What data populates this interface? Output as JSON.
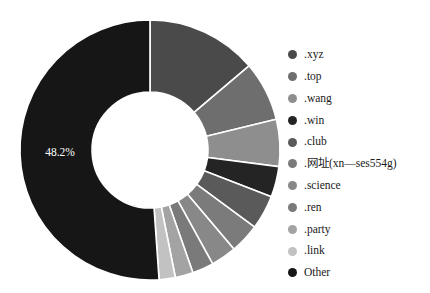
{
  "chart_data": {
    "type": "pie",
    "variant": "donut",
    "title": "",
    "subtitle": "",
    "xlabel": "",
    "ylabel": "",
    "legend_position": "right",
    "grid": false,
    "start_angle_deg": 0,
    "direction": "clockwise",
    "hole_ratio": 0.45,
    "labels_shown": [
      "48.2%"
    ],
    "categories": [
      ".xyz",
      ".top",
      ".wang",
      ".win",
      ".club",
      ".网址(xn—ses554g)",
      ".science",
      ".ren",
      ".party",
      ".link",
      "Other"
    ],
    "values": [
      13.0,
      7.0,
      5.5,
      3.6,
      4.0,
      3.5,
      3.0,
      2.5,
      2.1,
      1.9,
      48.2
    ],
    "unit": "%",
    "colors": [
      "#4a4a4a",
      "#6e6e6e",
      "#8e8e8e",
      "#242424",
      "#5a5a5a",
      "#7b7b7b",
      "#888888",
      "#7a7a7a",
      "#a3a3a3",
      "#c2c2c2",
      "#161616"
    ],
    "slices": [
      {
        "label": ".xyz",
        "value": 13.0,
        "color": "#4a4a4a"
      },
      {
        "label": ".top",
        "value": 7.0,
        "color": "#6e6e6e"
      },
      {
        "label": ".wang",
        "value": 5.5,
        "color": "#8e8e8e"
      },
      {
        "label": ".win",
        "value": 3.6,
        "color": "#242424"
      },
      {
        "label": ".club",
        "value": 4.0,
        "color": "#5a5a5a"
      },
      {
        "label": ".网址(xn—ses554g)",
        "value": 3.5,
        "color": "#7b7b7b"
      },
      {
        "label": ".science",
        "value": 3.0,
        "color": "#888888"
      },
      {
        "label": ".ren",
        "value": 2.5,
        "color": "#7a7a7a"
      },
      {
        "label": ".party",
        "value": 2.1,
        "color": "#a3a3a3"
      },
      {
        "label": ".link",
        "value": 1.9,
        "color": "#c2c2c2"
      },
      {
        "label": "Other",
        "value": 48.2,
        "color": "#161616"
      }
    ]
  },
  "annotations": {
    "other_percent_label": "48.2%"
  },
  "legend": {
    "items": [
      {
        "label": ".xyz",
        "color": "#4a4a4a"
      },
      {
        "label": ".top",
        "color": "#6e6e6e"
      },
      {
        "label": ".wang",
        "color": "#8e8e8e"
      },
      {
        "label": ".win",
        "color": "#242424"
      },
      {
        "label": ".club",
        "color": "#5a5a5a"
      },
      {
        "label": ".网址(xn—ses554g)",
        "color": "#7b7b7b"
      },
      {
        "label": ".science",
        "color": "#888888"
      },
      {
        "label": ".ren",
        "color": "#7a7a7a"
      },
      {
        "label": ".party",
        "color": "#a3a3a3"
      },
      {
        "label": ".link",
        "color": "#c2c2c2"
      },
      {
        "label": "Other",
        "color": "#161616"
      }
    ]
  },
  "geometry": {
    "center_x": 150,
    "center_y": 150,
    "outer_radius": 130,
    "inner_radius": 58
  }
}
